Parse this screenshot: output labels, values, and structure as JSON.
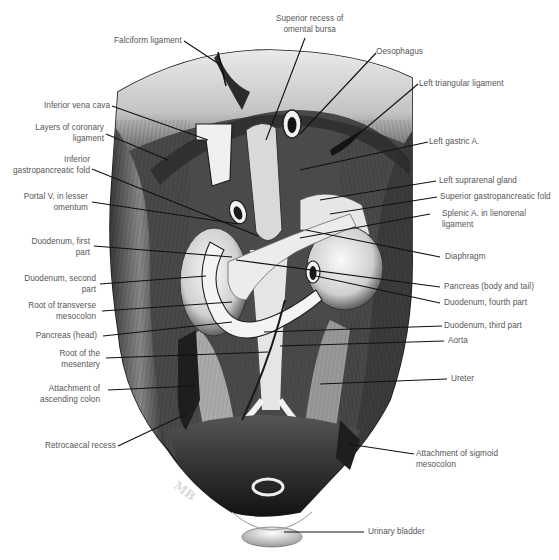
{
  "figure": {
    "type": "anatomical illustration",
    "signature": "MB",
    "palette": {
      "background": "#ffffff",
      "label_text": "#555555",
      "leader_line": "#111111",
      "tissue_dark": "#1a1a1a",
      "tissue_mid": "#6e6e6e",
      "tissue_light": "#e6e6e6"
    }
  },
  "labels": {
    "left": [
      {
        "id": "falciform-ligament",
        "text": "Falciform ligament"
      },
      {
        "id": "inferior-vena-cava",
        "text": "Inferior vena cava"
      },
      {
        "id": "layers-of-coronary-ligament",
        "text": "Layers of coronary\nligament"
      },
      {
        "id": "inferior-gastropancreatic-fold",
        "text": "Inferior\ngastropancreatic fold"
      },
      {
        "id": "portal-v-in-lesser-omentum",
        "text": "Portal V. in lesser\nomentum"
      },
      {
        "id": "duodenum-first-part",
        "text": "Duodenum, first\npart"
      },
      {
        "id": "duodenum-second-part",
        "text": "Duodenum, second\npart"
      },
      {
        "id": "root-of-transverse-mesocolon",
        "text": "Root of transverse\nmesocolon"
      },
      {
        "id": "pancreas-head",
        "text": "Pancreas (head)"
      },
      {
        "id": "root-of-the-mesentery",
        "text": "Root of the\nmesentery"
      },
      {
        "id": "attachment-of-ascending-colon",
        "text": "Attachment of\nascending colon"
      },
      {
        "id": "retrocaecal-recess",
        "text": "Retrocaecal recess"
      }
    ],
    "top": [
      {
        "id": "superior-recess-of-omental-bursa",
        "text": "Superior recess of\nomental bursa"
      },
      {
        "id": "oesophagus",
        "text": "Oesophagus"
      }
    ],
    "right": [
      {
        "id": "left-triangular-ligament",
        "text": "Left triangular ligament"
      },
      {
        "id": "left-gastric-a",
        "text": "Left gastric A."
      },
      {
        "id": "left-suprarenal-gland",
        "text": "Left suprarenal gland"
      },
      {
        "id": "superior-gastropancreatic-fold",
        "text": "Superior gastropancreatic fold"
      },
      {
        "id": "splenic-a-in-lienorenal-ligament",
        "text": "Splenic A. in lienorenal\nligament"
      },
      {
        "id": "diaphragm",
        "text": "Diaphragm"
      },
      {
        "id": "pancreas-body-and-tail",
        "text": "Pancreas (body and tail)"
      },
      {
        "id": "duodenum-fourth-part",
        "text": "Duodenum, fourth part"
      },
      {
        "id": "duodenum-third-part",
        "text": "Duodenum, third part"
      },
      {
        "id": "aorta",
        "text": "Aorta"
      },
      {
        "id": "ureter",
        "text": "Ureter"
      },
      {
        "id": "attachment-of-sigmoid-mesocolon",
        "text": "Attachment of sigmoid\nmesocolon"
      },
      {
        "id": "urinary-bladder",
        "text": "Urinary bladder"
      }
    ]
  }
}
